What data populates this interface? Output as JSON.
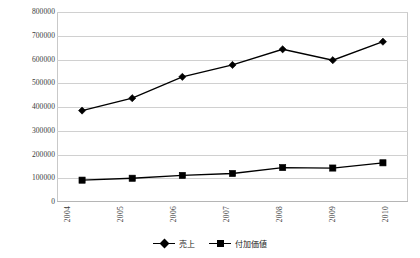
{
  "chart_data": {
    "type": "line",
    "title": "",
    "subtitle": "",
    "xlabel": "",
    "ylabel": "",
    "categories": [
      "2004",
      "2005",
      "2006",
      "2007",
      "2008",
      "2009",
      "2010"
    ],
    "ylim": [
      0,
      800000
    ],
    "ytick_step": 100000,
    "yticks": [
      "0",
      "100000",
      "200000",
      "300000",
      "400000",
      "500000",
      "600000",
      "700000",
      "800000"
    ],
    "ytick_values": [
      0,
      100000,
      200000,
      300000,
      400000,
      500000,
      600000,
      700000,
      800000
    ],
    "grid": "horizontal",
    "legend_position": "bottom-center",
    "xtick_rotation": 90,
    "series": [
      {
        "name": "売上",
        "marker": "diamond",
        "color": "#000000",
        "values": [
          385000,
          437000,
          527000,
          577000,
          643000,
          597000,
          675000
        ]
      },
      {
        "name": "付加価値",
        "marker": "square",
        "color": "#000000",
        "values": [
          92000,
          100000,
          112000,
          120000,
          145000,
          143000,
          165000
        ]
      }
    ]
  },
  "style": {
    "gridline_color": "#d0d0d0",
    "border_color": "#c9c9c9",
    "series_color": "#000000",
    "background": "#ffffff",
    "tick_label_color": "#3a3a3a"
  }
}
